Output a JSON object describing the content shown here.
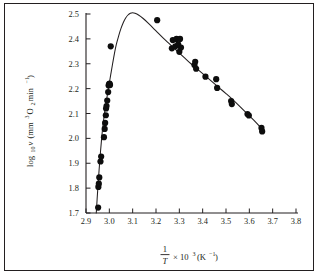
{
  "figure": {
    "background_color": "#ffffff",
    "border_color": "#231f20",
    "ink_color": "#231f20",
    "point_color": "#0d0d0d"
  },
  "chart_data": {
    "type": "scatter",
    "title": "",
    "subtitle": "",
    "xlabel": "1/T × 10³ (K⁻¹)",
    "xlabel_parts": {
      "numerator": "1",
      "denominator": "T",
      "multiplier": "× 10",
      "exponent": "3",
      "units": "(K",
      "units_exponent": "−1",
      "units_close": ")"
    },
    "ylabel": "log₁₀ν (mm³ O₂ min⁻¹)",
    "ylabel_parts": {
      "log": "log",
      "log_base": "10",
      "variable": "ν",
      "units_open": "(mm",
      "units_exp1": "3",
      "units_o": " O",
      "units_sub": "2",
      "units_min": " min",
      "units_exp2": "−1",
      "units_close": ")"
    },
    "xlim": [
      2.9,
      3.8
    ],
    "ylim": [
      1.7,
      2.5
    ],
    "xticks": [
      2.9,
      3.0,
      3.1,
      3.2,
      3.3,
      3.4,
      3.5,
      3.6,
      3.7,
      3.8
    ],
    "xtick_labels": [
      "2.9",
      "3.0",
      "3.1",
      "3.2",
      "3.3",
      "3.4",
      "3.5",
      "3.6",
      "3.7",
      "3.8"
    ],
    "yticks": [
      1.7,
      1.8,
      1.9,
      2.0,
      2.1,
      2.2,
      2.3,
      2.4,
      2.5
    ],
    "ytick_labels": [
      "1.7",
      "1.8",
      "1.9",
      "2.0",
      "2.1",
      "2.2",
      "2.3",
      "2.4",
      "2.5"
    ],
    "grid": false,
    "legend": null,
    "legend_position": "none",
    "series": [
      {
        "name": "measurements",
        "marker": "filled-circle",
        "marker_size": 3.1,
        "points": [
          [
            2.952,
            1.722
          ],
          [
            2.953,
            1.805
          ],
          [
            2.955,
            1.818
          ],
          [
            2.957,
            1.843
          ],
          [
            2.962,
            1.907
          ],
          [
            2.965,
            1.927
          ],
          [
            2.977,
            2.005
          ],
          [
            2.98,
            2.038
          ],
          [
            2.982,
            2.062
          ],
          [
            2.985,
            2.093
          ],
          [
            2.986,
            2.12
          ],
          [
            2.988,
            2.13
          ],
          [
            2.991,
            2.152
          ],
          [
            2.995,
            2.186
          ],
          [
            2.997,
            2.213
          ],
          [
            2.999,
            2.218
          ],
          [
            3.001,
            2.22
          ],
          [
            3.003,
            2.215
          ],
          [
            3.006,
            2.37
          ],
          [
            3.205,
            2.475
          ],
          [
            3.268,
            2.362
          ],
          [
            3.272,
            2.395
          ],
          [
            3.283,
            2.37
          ],
          [
            3.288,
            2.4
          ],
          [
            3.295,
            2.378
          ],
          [
            3.3,
            2.348
          ],
          [
            3.303,
            2.4
          ],
          [
            3.307,
            2.365
          ],
          [
            3.365,
            2.295
          ],
          [
            3.368,
            2.308
          ],
          [
            3.372,
            2.28
          ],
          [
            3.412,
            2.248
          ],
          [
            3.458,
            2.238
          ],
          [
            3.462,
            2.203
          ],
          [
            3.522,
            2.15
          ],
          [
            3.525,
            2.138
          ],
          [
            3.592,
            2.098
          ],
          [
            3.598,
            2.092
          ],
          [
            3.652,
            2.042
          ],
          [
            3.655,
            2.028
          ]
        ]
      }
    ],
    "fit_curve": {
      "name": "fitted-curve",
      "description": "rise-and-fall curve peaking near 3.10",
      "peak": [
        3.1,
        2.505
      ],
      "points": [
        [
          2.944,
          1.7
        ],
        [
          2.95,
          1.79
        ],
        [
          2.956,
          1.872
        ],
        [
          2.962,
          1.945
        ],
        [
          2.968,
          2.01
        ],
        [
          2.974,
          2.062
        ],
        [
          2.98,
          2.105
        ],
        [
          2.986,
          2.142
        ],
        [
          2.992,
          2.178
        ],
        [
          2.998,
          2.212
        ],
        [
          3.006,
          2.256
        ],
        [
          3.014,
          2.3
        ],
        [
          3.022,
          2.342
        ],
        [
          3.03,
          2.378
        ],
        [
          3.04,
          2.412
        ],
        [
          3.05,
          2.442
        ],
        [
          3.06,
          2.466
        ],
        [
          3.07,
          2.484
        ],
        [
          3.08,
          2.496
        ],
        [
          3.09,
          2.503
        ],
        [
          3.1,
          2.505
        ],
        [
          3.11,
          2.503
        ],
        [
          3.125,
          2.496
        ],
        [
          3.145,
          2.482
        ],
        [
          3.17,
          2.46
        ],
        [
          3.2,
          2.432
        ],
        [
          3.23,
          2.404
        ],
        [
          3.26,
          2.378
        ],
        [
          3.29,
          2.352
        ],
        [
          3.32,
          2.326
        ],
        [
          3.35,
          2.3
        ],
        [
          3.38,
          2.276
        ],
        [
          3.41,
          2.252
        ],
        [
          3.44,
          2.228
        ],
        [
          3.47,
          2.204
        ],
        [
          3.5,
          2.18
        ],
        [
          3.53,
          2.155
        ],
        [
          3.56,
          2.128
        ],
        [
          3.59,
          2.1
        ],
        [
          3.62,
          2.072
        ],
        [
          3.65,
          2.042
        ],
        [
          3.665,
          2.026
        ]
      ]
    }
  }
}
